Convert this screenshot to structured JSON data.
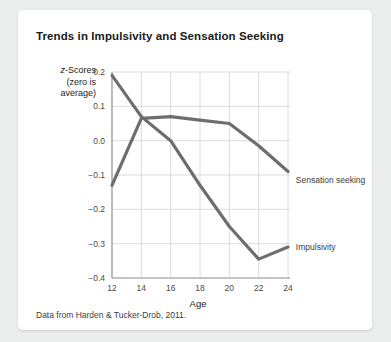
{
  "card": {
    "title": "Trends in Impulsivity and Sensation Seeking",
    "source_note": "Data from Harden & Tucker-Drob, 2011."
  },
  "axis": {
    "y_label_line1": "z-Scores",
    "y_label_line2": "(zero is",
    "y_label_line3": "average)",
    "y_label_italic_char": "z",
    "y_label_rest_line1": "-Scores",
    "x_title": "Age"
  },
  "series_labels": {
    "sensation_seeking": "Sensation seeking",
    "impulsivity": "Impulsivity"
  },
  "colors": {
    "line": "#6e6e6e",
    "grid": "#dcdcdc",
    "axis": "#9a9a9a",
    "card_bg": "#ffffff",
    "page_bg": "#eceded",
    "title_text": "#1a1a1a",
    "tick_text": "#4a4a4a"
  },
  "chart_data": {
    "type": "line",
    "title": "Trends in Impulsivity and Sensation Seeking",
    "xlabel": "Age",
    "ylabel": "z-Scores (zero is average)",
    "xlim": [
      12,
      24
    ],
    "ylim": [
      -0.4,
      0.2
    ],
    "xticks": [
      12,
      14,
      16,
      18,
      20,
      22,
      24
    ],
    "yticks": [
      0.2,
      0.1,
      0.0,
      -0.1,
      -0.2,
      -0.3,
      -0.4
    ],
    "grid": true,
    "legend": "inline-annotations",
    "x": [
      12,
      14,
      16,
      18,
      20,
      22,
      24
    ],
    "series": [
      {
        "name": "Impulsivity",
        "values": [
          0.19,
          0.07,
          0.0,
          -0.13,
          -0.25,
          -0.345,
          -0.31
        ],
        "label_x": 24.4,
        "label_y": -0.31
      },
      {
        "name": "Sensation seeking",
        "values": [
          -0.13,
          0.065,
          0.07,
          0.06,
          0.05,
          -0.015,
          -0.09
        ],
        "label_x": 24.4,
        "label_y": -0.115
      }
    ]
  }
}
